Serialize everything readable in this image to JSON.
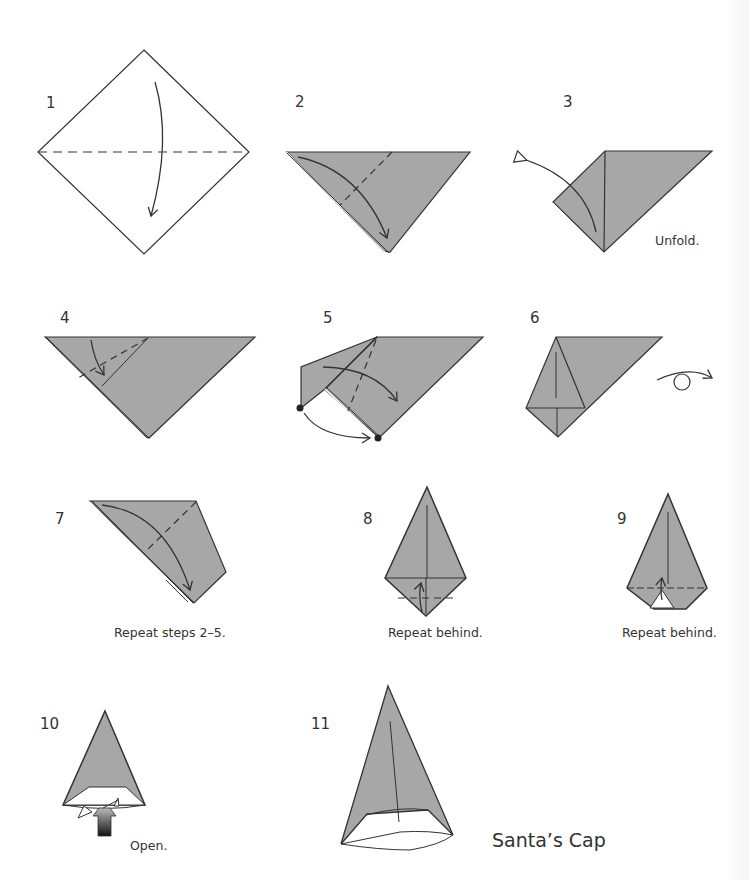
{
  "document": {
    "title": "Santa's Cap",
    "paper_color": "#a7a7a7",
    "line_color": "#333333",
    "steps": [
      {
        "number": "1",
        "caption": ""
      },
      {
        "number": "2",
        "caption": ""
      },
      {
        "number": "3",
        "caption": "Unfold."
      },
      {
        "number": "4",
        "caption": ""
      },
      {
        "number": "5",
        "caption": ""
      },
      {
        "number": "6",
        "caption": ""
      },
      {
        "number": "7",
        "caption": "Repeat steps 2–5."
      },
      {
        "number": "8",
        "caption": "Repeat behind."
      },
      {
        "number": "9",
        "caption": "Repeat behind."
      },
      {
        "number": "10",
        "caption": "Open."
      },
      {
        "number": "11",
        "caption": ""
      }
    ],
    "final_label": "Santa’s Cap"
  }
}
